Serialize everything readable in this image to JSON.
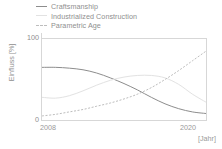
{
  "legend": {
    "position": "top-left",
    "items": [
      {
        "label": "Craftsmanship",
        "marker": "solid-line-icon",
        "color": "#8d8d8d"
      },
      {
        "label": "Industrialized Construction",
        "marker": "faint-line-icon",
        "color": "#e2e2e2"
      },
      {
        "label": "Parametric Age",
        "marker": "dashed-line-icon",
        "color": "#bdbdbd"
      }
    ]
  },
  "axes": {
    "ylabel": "Einfluss [%]",
    "yticks": [
      "0",
      "100"
    ],
    "xticks": [
      "2008",
      "2020"
    ],
    "xunit": "[Jahr]"
  },
  "chart_data": {
    "type": "line",
    "title": "",
    "xlabel": "[Jahr]",
    "ylabel": "Einfluss [%]",
    "xlim": [
      2008,
      2020
    ],
    "ylim": [
      0,
      100
    ],
    "grid": false,
    "legend_position": "top-left",
    "x": [
      2008,
      2009,
      2010,
      2011,
      2012,
      2013,
      2014,
      2015,
      2016,
      2017,
      2018,
      2019,
      2020
    ],
    "series": [
      {
        "name": "Craftsmanship",
        "color": "#8d8d8d",
        "style": "solid",
        "values": [
          65,
          65,
          64,
          62,
          58,
          52,
          45,
          37,
          28,
          20,
          14,
          10,
          8
        ]
      },
      {
        "name": "Industrialized Construction",
        "color": "#e2e2e2",
        "style": "solid",
        "values": [
          28,
          27,
          30,
          36,
          43,
          49,
          53,
          55,
          55,
          52,
          44,
          32,
          22
        ]
      },
      {
        "name": "Parametric Age",
        "color": "#bdbdbd",
        "style": "dashed",
        "values": [
          5,
          7,
          10,
          13,
          17,
          21,
          26,
          32,
          40,
          50,
          61,
          73,
          85
        ]
      }
    ]
  }
}
